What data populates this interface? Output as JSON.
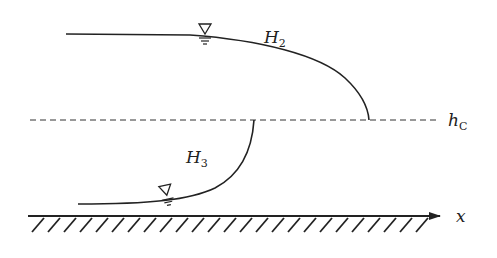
{
  "diagram": {
    "curves": [
      {
        "name": "H2",
        "label": "H",
        "subscript": "2"
      },
      {
        "name": "H3",
        "label": "H",
        "subscript": "3"
      }
    ],
    "critical_depth": {
      "label": "h",
      "subscript": "C"
    },
    "axis": {
      "label": "x"
    },
    "colors": {
      "line": "#222222",
      "background": "#ffffff"
    }
  }
}
